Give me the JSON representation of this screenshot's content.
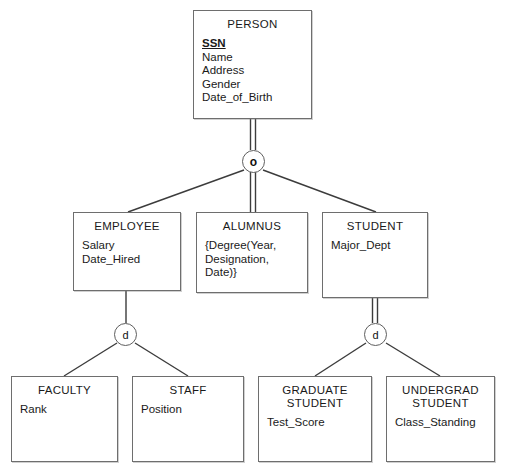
{
  "diagram": {
    "kind": "eer-specialization-diagram",
    "notation_symbols": {
      "overlapping": "o",
      "disjoint": "d"
    },
    "line_colors": {
      "stroke": "#3c3c3c",
      "box_border": "#6e6e6e"
    }
  },
  "entities": {
    "person": {
      "name": "PERSON",
      "attributes": [
        "SSN",
        "Name",
        "Address",
        "Gender",
        "Date_of_Birth"
      ],
      "key_attribute": "SSN"
    },
    "employee": {
      "name": "EMPLOYEE",
      "attributes": [
        "Salary",
        "Date_Hired"
      ]
    },
    "alumnus": {
      "name": "ALUMNUS",
      "attributes": [
        "{Degree(Year,",
        "Designation,",
        "Date)}"
      ]
    },
    "student": {
      "name": "STUDENT",
      "attributes": [
        "Major_Dept"
      ]
    },
    "faculty": {
      "name": "FACULTY",
      "attributes": [
        "Rank"
      ]
    },
    "staff": {
      "name": "STAFF",
      "attributes": [
        "Position"
      ]
    },
    "graduate_student": {
      "name_line1": "GRADUATE",
      "name_line2": "STUDENT",
      "attributes": [
        "Test_Score"
      ]
    },
    "undergrad_student": {
      "name_line1": "UNDERGRAD",
      "name_line2": "STUDENT",
      "attributes": [
        "Class_Standing"
      ]
    }
  },
  "specializations": {
    "person_spec": {
      "symbol": "o",
      "type": "overlapping",
      "superclass": "PERSON",
      "subclasses": [
        "EMPLOYEE",
        "ALUMNUS",
        "STUDENT"
      ]
    },
    "employee_spec": {
      "symbol": "d",
      "type": "disjoint",
      "superclass": "EMPLOYEE",
      "subclasses": [
        "FACULTY",
        "STAFF"
      ]
    },
    "student_spec": {
      "symbol": "d",
      "type": "disjoint",
      "superclass": "STUDENT",
      "subclasses": [
        "GRADUATE STUDENT",
        "UNDERGRAD STUDENT"
      ]
    }
  }
}
